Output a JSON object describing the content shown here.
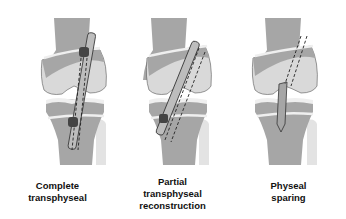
{
  "figure": {
    "panels": [
      {
        "label_line1": "Complete",
        "label_line2": "transphyseal",
        "label_line3": ""
      },
      {
        "label_line1": "Partial",
        "label_line2": "transphyseal",
        "label_line3": "reconstruction"
      },
      {
        "label_line1": "Physeal",
        "label_line2": "sparing",
        "label_line3": ""
      }
    ],
    "colors": {
      "bone_dark": "#a6a6a6",
      "bone_light": "#d9d9d9",
      "physis": "#efefef",
      "fibula": "#e3e3e3",
      "fixation": "#444444",
      "outline": "#333333"
    }
  }
}
